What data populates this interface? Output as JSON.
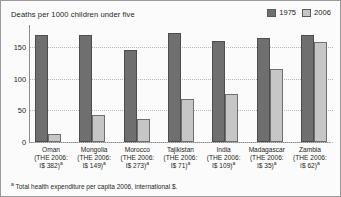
{
  "chart_data": {
    "type": "bar",
    "title": "Deaths per 1000 children under five",
    "xlabel": "",
    "ylabel": "",
    "ylim": [
      0,
      185
    ],
    "yticks": [
      0,
      50,
      100,
      150
    ],
    "grid": true,
    "legend_position": "top-right",
    "categories": [
      "Oman",
      "Mongolia",
      "Morocco",
      "Tajikistan",
      "India",
      "Madagascar",
      "Zambia"
    ],
    "category_sublabels": [
      "(THE 2006: I$ 382)",
      "(THE 2006: I$ 149)",
      "(THE 2006: I$ 273)",
      "(THE 2006: I$ 71)",
      "(THE 2006: I$ 109)",
      "(THE 2006: I$ 35)",
      "(THE 2006: I$ 62)"
    ],
    "series": [
      {
        "name": "1975",
        "color": "#6f6f6f",
        "values": [
          170,
          170,
          145,
          172,
          160,
          165,
          170
        ]
      },
      {
        "name": "2006",
        "color": "#c6c6c6",
        "values": [
          12,
          43,
          37,
          68,
          76,
          115,
          158
        ]
      }
    ],
    "footnote": "Total health expenditure per capita 2006, international $.",
    "footnote_mark": "a"
  },
  "header": {
    "title": "Deaths per 1000 children under five"
  },
  "legend": {
    "items": [
      {
        "label": "1975",
        "color": "#6f6f6f"
      },
      {
        "label": "2006",
        "color": "#c6c6c6"
      }
    ]
  },
  "axis": {
    "yticks": [
      "150",
      "100",
      "50",
      "0"
    ]
  },
  "xcategories": [
    {
      "name": "Oman",
      "line2": "(THE 2006:",
      "line3": "I$ 382)",
      "mark": "a"
    },
    {
      "name": "Mongolia",
      "line2": "(THE 2006:",
      "line3": "I$ 149)",
      "mark": "a"
    },
    {
      "name": "Morocco",
      "line2": "(THE 2006:",
      "line3": "I$ 273)",
      "mark": "a"
    },
    {
      "name": "Tajikistan",
      "line2": "(THE 2006:",
      "line3": "I$ 71)",
      "mark": "a"
    },
    {
      "name": "India",
      "line2": "(THE 2006:",
      "line3": "I$ 109)",
      "mark": "a"
    },
    {
      "name": "Madagascar",
      "line2": "(THE 2006:",
      "line3": "I$ 35)",
      "mark": "a"
    },
    {
      "name": "Zambia",
      "line2": "(THE 2006:",
      "line3": "I$ 62)",
      "mark": "a"
    }
  ],
  "footnote": {
    "mark": "a",
    "text": "Total health expenditure per capita 2006, international $."
  }
}
